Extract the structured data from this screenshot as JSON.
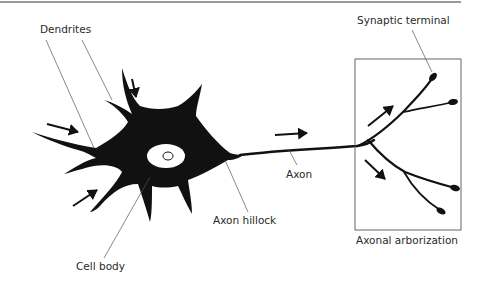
{
  "figure": {
    "type": "neuron-anatomy-diagram",
    "labels": {
      "dendrites": "Dendrites",
      "synaptic_terminal": "Synaptic terminal",
      "axon": "Axon",
      "axon_hillock": "Axon hillock",
      "cell_body": "Cell body",
      "axonal_arborization": "Axonal arborization"
    },
    "colors": {
      "ink": "#111111",
      "leader_lines": "#555555",
      "background": "#ffffff",
      "top_rule": "#777777"
    },
    "signal_direction_arrows": 6
  }
}
